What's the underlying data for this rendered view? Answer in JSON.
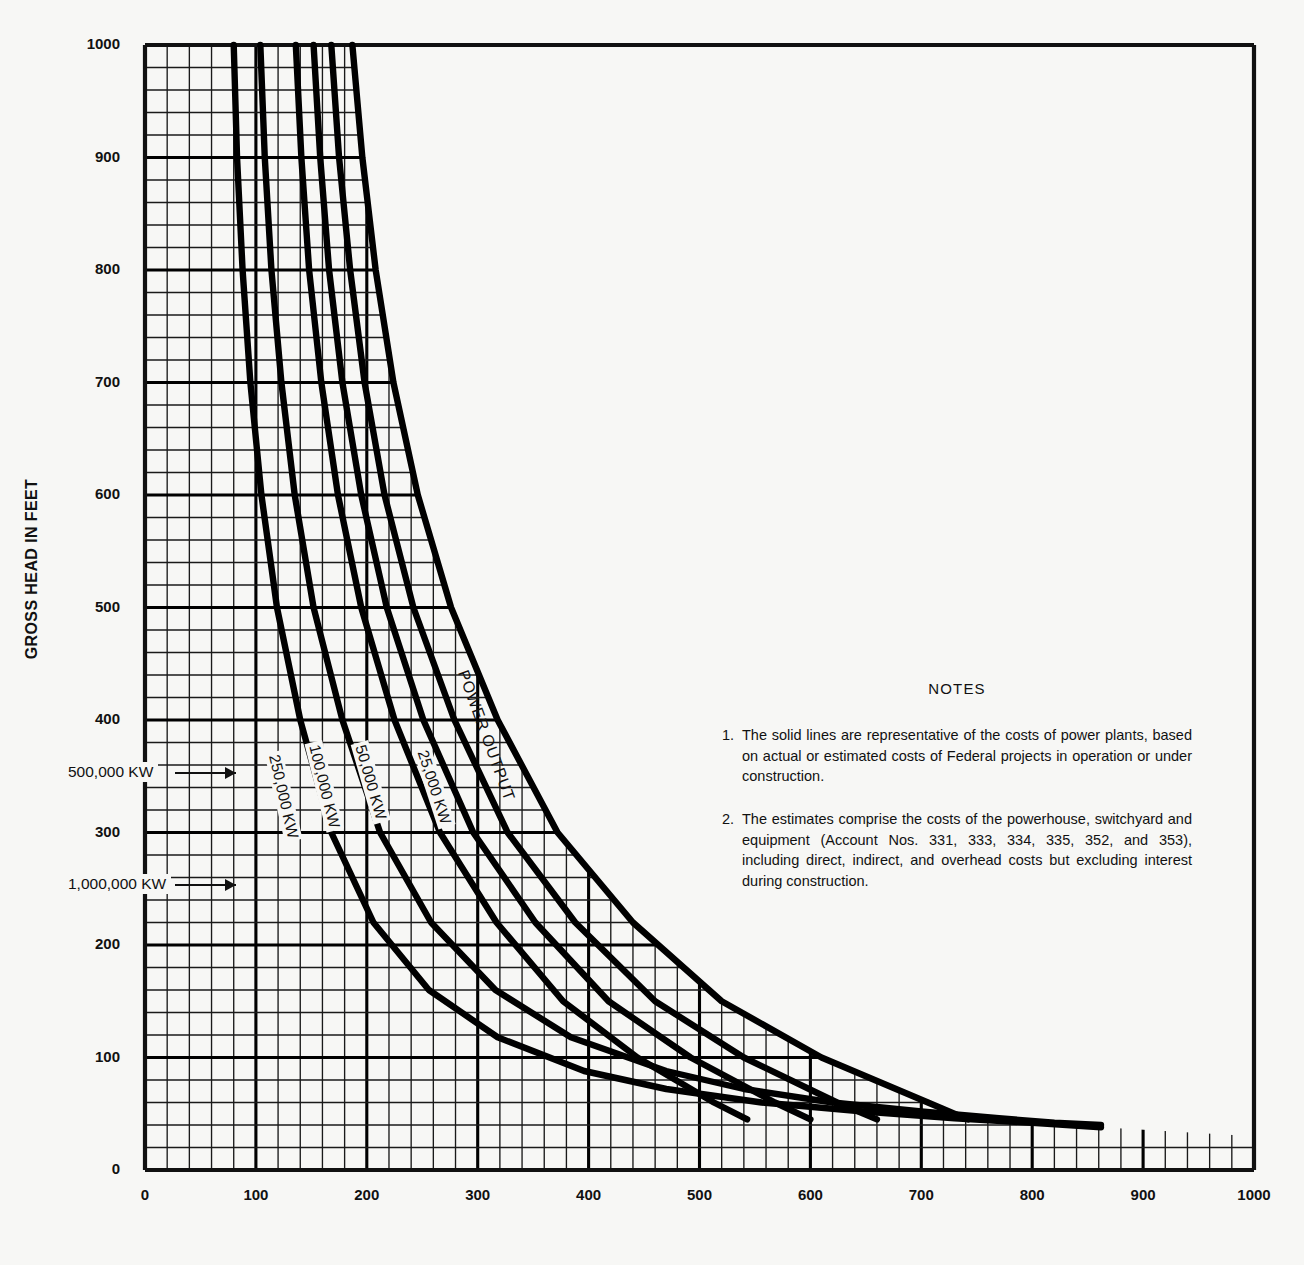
{
  "figure": {
    "title": "",
    "y_axis_title": "GROSS HEAD IN FEET",
    "x_axis_title": ""
  },
  "notes": {
    "heading": "NOTES",
    "items": [
      {
        "num": "1.",
        "text": "The solid lines are representative of the costs of power plants, based on actual or estimated costs of Federal projects in operation or under construction."
      },
      {
        "num": "2.",
        "text": "The estimates comprise the costs of the powerhouse, switchyard and equipment (Account Nos. 331, 333, 334, 335, 352, and 353), including direct, indirect, and overhead costs but excluding interest during construction."
      }
    ]
  },
  "chart_data": {
    "type": "line",
    "title": "",
    "xlabel": "",
    "ylabel": "GROSS HEAD IN FEET",
    "xlim": [
      0,
      1000
    ],
    "ylim": [
      0,
      1000
    ],
    "xticks": [
      0,
      100,
      200,
      300,
      400,
      500,
      600,
      700,
      800,
      900,
      1000
    ],
    "yticks": [
      0,
      100,
      200,
      300,
      400,
      500,
      600,
      700,
      800,
      900,
      1000
    ],
    "xticklabels": [
      "0",
      "100",
      "200",
      "300",
      "400",
      "500",
      "600",
      "700",
      "800",
      "900",
      "1000"
    ],
    "yticklabels": [
      "0",
      "100",
      "200",
      "300",
      "400",
      "500",
      "600",
      "700",
      "800",
      "900",
      "1000"
    ],
    "grid": true,
    "grid_minor_step": 20,
    "grid_major_step": 100,
    "legend": "inline-curve-labels",
    "annotations": [
      "POWER OUTPUT"
    ],
    "series": [
      {
        "name": "25,000 KW",
        "label": "25,000 KW",
        "x": [
          187,
          196,
          208,
          224,
          246,
          276,
          318,
          372,
          440,
          520,
          610,
          706,
          742
        ],
        "y": [
          1000,
          900,
          800,
          700,
          600,
          500,
          400,
          300,
          220,
          150,
          100,
          60,
          45
        ]
      },
      {
        "name": "50,000 KW",
        "label": "50,000 KW",
        "x": [
          168,
          175,
          185,
          198,
          216,
          242,
          279,
          327,
          388,
          460,
          540,
          624,
          660
        ],
        "y": [
          1000,
          900,
          800,
          700,
          600,
          500,
          400,
          300,
          220,
          150,
          100,
          60,
          45
        ]
      },
      {
        "name": "100,000 KW",
        "label": "100,000 KW",
        "x": [
          152,
          158,
          166,
          178,
          195,
          218,
          251,
          296,
          352,
          418,
          492,
          568,
          600
        ],
        "y": [
          1000,
          900,
          800,
          700,
          600,
          500,
          400,
          300,
          220,
          150,
          100,
          60,
          45
        ]
      },
      {
        "name": "250,000 KW",
        "label": "250,000 KW",
        "x": [
          136,
          141,
          148,
          159,
          174,
          195,
          225,
          266,
          317,
          377,
          444,
          513,
          543
        ],
        "y": [
          1000,
          900,
          800,
          700,
          600,
          500,
          400,
          300,
          220,
          150,
          100,
          60,
          45
        ]
      },
      {
        "name": "500,000 KW",
        "label": "500,000 KW",
        "x": [
          104,
          108,
          114,
          123,
          135,
          152,
          178,
          212,
          258,
          316,
          384,
          470,
          540,
          620,
          700,
          770,
          820,
          862
        ],
        "y": [
          1000,
          900,
          800,
          700,
          600,
          500,
          400,
          300,
          220,
          160,
          118,
          88,
          72,
          60,
          52,
          46,
          42,
          40
        ]
      },
      {
        "name": "1,000,000 KW",
        "label": "1,000,000 KW",
        "x": [
          80,
          83,
          88,
          95,
          105,
          119,
          140,
          168,
          206,
          256,
          318,
          396,
          470,
          556,
          648,
          730,
          800,
          862
        ],
        "y": [
          1000,
          900,
          800,
          700,
          600,
          500,
          400,
          300,
          220,
          160,
          118,
          88,
          72,
          60,
          52,
          46,
          42,
          38
        ]
      }
    ],
    "curve_labels": [
      {
        "text": "25,000 KW",
        "x": 430,
        "y": 745,
        "rotation": 72
      },
      {
        "text": "50,000 KW",
        "x": 368,
        "y": 740,
        "rotation": 74
      },
      {
        "text": "100,000 KW",
        "x": 322,
        "y": 740,
        "rotation": 76
      },
      {
        "text": "250,000 KW",
        "x": 282,
        "y": 750,
        "rotation": 77
      },
      {
        "text": "500,000 KW",
        "x": 63,
        "y": 762,
        "rotation": 0,
        "arrow": true
      },
      {
        "text": "1,000,000 KW",
        "x": 63,
        "y": 874,
        "rotation": 0,
        "arrow": true
      }
    ],
    "power_output_annotation": {
      "text": "POWER OUTPUT",
      "x": 470,
      "y": 668,
      "rotation": 70
    }
  },
  "colors": {
    "background": "#f7f7f5",
    "ink": "#111111",
    "grid_minor": "#1a1a1a",
    "grid_major": "#000000",
    "curve": "#000000"
  }
}
